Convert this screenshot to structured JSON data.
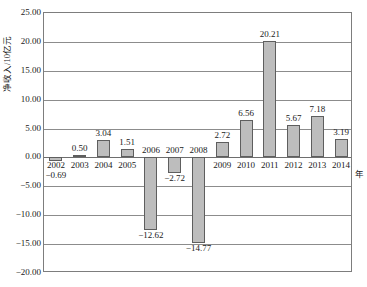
{
  "chart_data": {
    "type": "bar",
    "title": "",
    "xlabel": "年",
    "ylabel": "净收入/10亿元",
    "categories": [
      "2002",
      "2003",
      "2004",
      "2005",
      "2006",
      "2007",
      "2008",
      "2009",
      "2010",
      "2011",
      "2012",
      "2013",
      "2014"
    ],
    "values": [
      -0.69,
      0.5,
      3.04,
      1.51,
      -12.62,
      -2.72,
      -14.77,
      2.72,
      6.56,
      20.21,
      5.67,
      7.18,
      3.19
    ],
    "value_labels": [
      "−0.69",
      "0.50",
      "3.04",
      "1.51",
      "−12.62",
      "−2.72",
      "−14.77",
      "2.72",
      "6.56",
      "20.21",
      "5.67",
      "7.18",
      "3.19"
    ],
    "ylim": [
      -20.0,
      25.0
    ],
    "ytick_values": [
      25.0,
      20.0,
      15.0,
      10.0,
      5.0,
      0.0,
      -5.0,
      -10.0,
      -15.0,
      -20.0
    ],
    "ytick_labels": [
      "25.00",
      "20.00",
      "15.00",
      "10.00",
      "5.00",
      "0.00",
      "−5.00",
      "−10.00",
      "−15.00",
      "−20.00"
    ],
    "grid": true,
    "legend": "none",
    "bar_color": "#bdbdbd",
    "bar_border_color": "#5e5e5e",
    "axis_color": "#7d7d7d",
    "grid_color": "#8c8c8c"
  }
}
